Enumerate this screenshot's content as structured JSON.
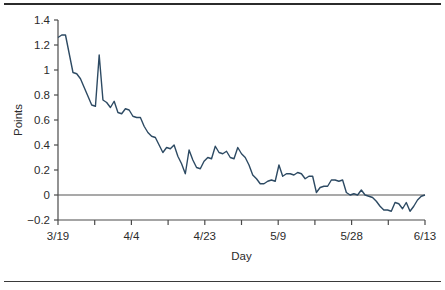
{
  "figure": {
    "top_rule": "horizontal-rule",
    "bottom_rule": "horizontal-rule"
  },
  "chart_data": {
    "type": "line",
    "title": "",
    "xlabel": "Day",
    "ylabel": "Points",
    "ylim": [
      -0.2,
      1.4
    ],
    "ytick_labels": [
      "1.4",
      "1.2",
      "1",
      "0.8",
      "0.6",
      "0.4",
      "0.2",
      "0",
      "−0.2"
    ],
    "ytick_values": [
      1.4,
      1.2,
      1.0,
      0.8,
      0.6,
      0.4,
      0.2,
      0,
      -0.2
    ],
    "xtick_labels": [
      "3/19",
      "4/4",
      "4/23",
      "5/9",
      "5/28",
      "6/13"
    ],
    "xtick_label_index": [
      0,
      2,
      4,
      6,
      8,
      10
    ],
    "xtick_count": 11,
    "grid": false,
    "legend": "none",
    "zero_line": true,
    "line_color": "#2d4a63",
    "axis_color": "#4a4a4a",
    "series": [
      {
        "name": "Points",
        "values": [
          1.26,
          1.28,
          1.28,
          1.13,
          0.98,
          0.97,
          0.93,
          0.86,
          0.79,
          0.72,
          0.71,
          1.12,
          0.76,
          0.74,
          0.7,
          0.75,
          0.66,
          0.65,
          0.69,
          0.68,
          0.63,
          0.62,
          0.62,
          0.55,
          0.5,
          0.47,
          0.46,
          0.4,
          0.34,
          0.38,
          0.37,
          0.4,
          0.31,
          0.25,
          0.17,
          0.36,
          0.28,
          0.22,
          0.21,
          0.27,
          0.3,
          0.29,
          0.39,
          0.34,
          0.33,
          0.35,
          0.3,
          0.29,
          0.38,
          0.33,
          0.3,
          0.24,
          0.16,
          0.13,
          0.09,
          0.09,
          0.11,
          0.12,
          0.11,
          0.24,
          0.15,
          0.17,
          0.17,
          0.16,
          0.18,
          0.17,
          0.13,
          0.15,
          0.15,
          0.02,
          0.06,
          0.07,
          0.07,
          0.12,
          0.12,
          0.11,
          0.12,
          0.02,
          0.0,
          0.01,
          0.0,
          0.04,
          0.0,
          -0.01,
          -0.02,
          -0.05,
          -0.09,
          -0.12,
          -0.12,
          -0.13,
          -0.06,
          -0.07,
          -0.11,
          -0.06,
          -0.13,
          -0.09,
          -0.04,
          -0.01,
          0.0
        ]
      }
    ]
  }
}
